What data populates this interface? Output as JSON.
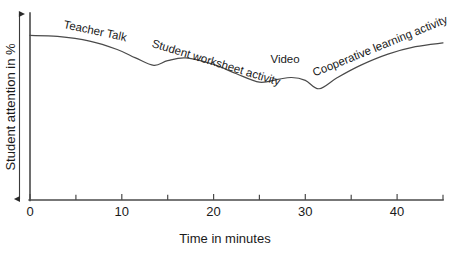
{
  "chart_data": {
    "type": "line",
    "title": "",
    "subtitle": "",
    "xlabel": "Time in minutes",
    "ylabel": "Student attention in %",
    "xlim": [
      0,
      45
    ],
    "ylim": [
      0,
      100
    ],
    "grid": false,
    "legend_position": "none",
    "x_ticks_major": [
      0,
      10,
      20,
      30,
      40
    ],
    "x_tick_labels": [
      "0",
      "10",
      "20",
      "30",
      "40"
    ],
    "x_ticks_minor": [
      5,
      15,
      25,
      35,
      45
    ],
    "y_axis_style": "double-headed-arrow-unlabeled",
    "y_tick_labels": [],
    "series": [
      {
        "name": "Student attention",
        "x": [
          0,
          3,
          6.5,
          9.5,
          11.5,
          13.5,
          15,
          17,
          20,
          22.5,
          25,
          27,
          28.5,
          30,
          31.5,
          33.5,
          36,
          39,
          42,
          45
        ],
        "y": [
          88,
          87.5,
          85,
          80.5,
          76,
          72,
          74.5,
          76,
          72.5,
          67.5,
          63,
          64.5,
          65.5,
          64,
          59.5,
          65.5,
          72,
          78,
          82,
          84
        ]
      }
    ],
    "annotations": [
      {
        "text": "Teacher Talk",
        "x": 3.6,
        "y": 92,
        "rotation": 12
      },
      {
        "text": "Student worksheet activity",
        "x": 13.2,
        "y": 82,
        "rotation": 17
      },
      {
        "text": "Video",
        "x": 26.2,
        "y": 73,
        "rotation": 0
      },
      {
        "text": "Cooperative learning activity",
        "x": 31.0,
        "y": 66,
        "rotation": -22
      }
    ]
  },
  "colors": {
    "curve": "#4a4a4a",
    "axis": "#4a4a4a",
    "text": "#1a1a1a",
    "background": "#ffffff"
  }
}
